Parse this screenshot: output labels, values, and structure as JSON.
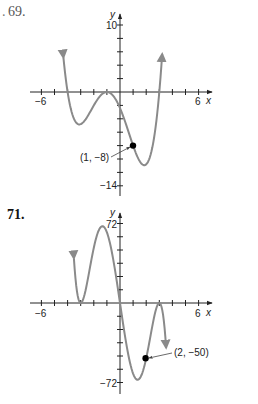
{
  "problems": [
    {
      "number": "69."
    },
    {
      "number": "71."
    }
  ],
  "chart_data": [
    {
      "type": "line",
      "title": "69.",
      "xlabel": "x",
      "ylabel": "y",
      "xlim": [
        -6,
        6
      ],
      "ylim": [
        -14,
        10
      ],
      "x_tick_step": 1,
      "y_tick_step": 2,
      "tick_labels": {
        "x": [
          "-6",
          "6"
        ],
        "y": [
          "10",
          "-14"
        ]
      },
      "curve_color": "#8a8a8a",
      "function_form": "f(x) = 0.2(x+4)(x+1)^2(x-3)",
      "series": [
        {
          "name": "f",
          "x": [
            -4.3,
            -4,
            -3.5,
            -3,
            -2.5,
            -2,
            -1.5,
            -1,
            -0.5,
            0,
            0.5,
            1,
            1.5,
            2,
            2.5,
            3,
            3.2
          ],
          "y": [
            10,
            0,
            -4.7,
            -4.8,
            -3.1,
            -1.2,
            -0.18,
            0,
            -0.6,
            -2.4,
            -5.1,
            -8,
            -10.1,
            -10.8,
            -8.6,
            0,
            4.7
          ]
        }
      ],
      "annotations": [
        {
          "label": "(1, −8)",
          "x": 1,
          "y": -8,
          "marker": "dot"
        }
      ],
      "x_intercepts": [
        -4,
        -1,
        3
      ],
      "y_intercept": -2.4
    },
    {
      "type": "line",
      "title": "71.",
      "xlabel": "x",
      "ylabel": "y",
      "xlim": [
        -6,
        6
      ],
      "ylim": [
        -72,
        72
      ],
      "x_tick_step": 1,
      "y_tick_step": 12,
      "tick_labels": {
        "x": [
          "-6",
          "6"
        ],
        "y": [
          "72",
          "-72"
        ]
      },
      "curve_color": "#8a8a8a",
      "function_form": "f(x) = -x(x+3)^2(x-3)^2",
      "series": [
        {
          "name": "f",
          "x": [
            -3.5,
            -3,
            -2.5,
            -2,
            -1.5,
            -1,
            -0.5,
            0,
            0.5,
            1,
            1.5,
            2,
            2.5,
            3,
            3.5
          ],
          "y": [
            70,
            0,
            42.2,
            50,
            61.6,
            48,
            30.6,
            0,
            -30.6,
            -48,
            -61.6,
            -50,
            -42.2,
            0,
            -70
          ]
        }
      ],
      "annotations": [
        {
          "label": "(2, −50)",
          "x": 2,
          "y": -50,
          "marker": "dot"
        }
      ],
      "x_intercepts": [
        -3,
        0,
        3
      ],
      "y_intercept": 0
    }
  ],
  "graph1": {
    "y_axis_label": "y",
    "x_axis_label": "x",
    "x_min_label": "−6",
    "x_max_label": "6",
    "y_max_label": "10",
    "y_min_label": "−14",
    "point_label": "(1, −8)"
  },
  "graph2": {
    "y_axis_label": "y",
    "x_axis_label": "x",
    "x_min_label": "−6",
    "x_max_label": "6",
    "y_max_label": "72",
    "y_min_label": "−72",
    "point_label": "(2, −50)"
  }
}
